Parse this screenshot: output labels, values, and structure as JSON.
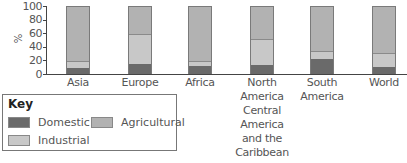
{
  "chart_data": {
    "type": "bar",
    "stacked": true,
    "title": "",
    "xlabel": "",
    "ylabel": "%",
    "ylim": [
      0,
      100
    ],
    "yticks": [
      "0",
      "20",
      "40",
      "60",
      "80",
      "100"
    ],
    "categories": [
      "Asia",
      "Europe",
      "Africa",
      "North America Central America and the Caribbean",
      "South America",
      "World"
    ],
    "category_lines": [
      [
        "Asia"
      ],
      [
        "Europe"
      ],
      [
        "Africa"
      ],
      [
        "North",
        "America",
        "Central",
        "America",
        "and the",
        "Caribbean"
      ],
      [
        "South",
        "America"
      ],
      [
        "World"
      ]
    ],
    "series": [
      {
        "name": "Domestic",
        "color": "#6a6a6a",
        "values": [
          9,
          15,
          12,
          13,
          23,
          10
        ]
      },
      {
        "name": "Industrial",
        "color": "#c8c8c8",
        "values": [
          10,
          45,
          7,
          39,
          12,
          21
        ]
      },
      {
        "name": "Agricultural",
        "color": "#b2b2b2",
        "values": [
          81,
          40,
          81,
          48,
          65,
          69
        ]
      }
    ],
    "grid": false,
    "legend": {
      "title": "Key",
      "position": "bottom-left",
      "entries": [
        "Domestic",
        "Agricultural",
        "Industrial"
      ]
    }
  },
  "key": {
    "title": "Key",
    "domestic": "Domestic",
    "agricultural": "Agricultural",
    "industrial": "Industrial"
  },
  "axis": {
    "ylabel": "%",
    "t0": "0",
    "t20": "20",
    "t40": "40",
    "t60": "60",
    "t80": "80",
    "t100": "100"
  },
  "labels": {
    "asia": "Asia",
    "europe": "Europe",
    "africa": "Africa",
    "na1": "North",
    "na2": "America",
    "na3": "Central",
    "na4": "America",
    "na5": "and the",
    "na6": "Caribbean",
    "sa1": "South",
    "sa2": "America",
    "world": "World"
  }
}
